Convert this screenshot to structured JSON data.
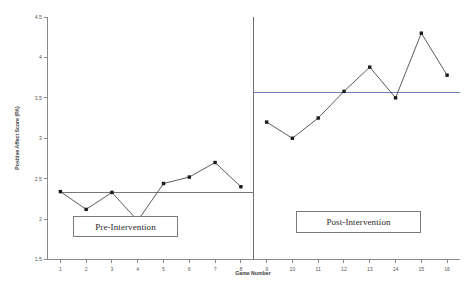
{
  "chart_data": {
    "type": "line",
    "title": "",
    "xlabel": "Game Number",
    "ylabel": "Positive Affect Score (PA)",
    "xlim": [
      0.5,
      16.5
    ],
    "ylim": [
      1.5,
      4.5
    ],
    "grid": false,
    "legend": null,
    "x": [
      1,
      2,
      3,
      4,
      5,
      6,
      7,
      8,
      9,
      10,
      11,
      12,
      13,
      14,
      15,
      16
    ],
    "xticklabels": [
      "1",
      "2",
      "3",
      "4",
      "5",
      "6",
      "7",
      "8",
      "9",
      "10",
      "11",
      "12",
      "13",
      "14",
      "15",
      "16"
    ],
    "yticks": [
      1.5,
      2,
      2.5,
      3,
      3.5,
      4,
      4.5
    ],
    "yticklabels": [
      "1.5",
      "2",
      "2.5",
      "3",
      "3.5",
      "4",
      "4.5"
    ],
    "series": [
      {
        "name": "Pre-Intervention",
        "x": [
          1,
          2,
          3,
          4,
          5,
          6,
          7,
          8
        ],
        "values": [
          2.34,
          2.12,
          2.33,
          1.98,
          2.44,
          2.52,
          2.7,
          2.4
        ]
      },
      {
        "name": "Post-Intervention",
        "x": [
          9,
          10,
          11,
          12,
          13,
          14,
          15,
          16
        ],
        "values": [
          3.2,
          3.0,
          3.25,
          3.58,
          3.88,
          3.5,
          4.3,
          3.78
        ]
      }
    ],
    "mean_lines": [
      {
        "name": "pre-intervention-mean",
        "value": 2.33,
        "x_start": 1,
        "x_end": 8.5,
        "color": "#777777"
      },
      {
        "name": "post-intervention-mean",
        "value": 3.56,
        "x_start": 8.5,
        "x_end": 16.5,
        "color": "#6a7fbf"
      }
    ],
    "phase_divider_x": 8.5,
    "annotations": [
      {
        "name": "pre-intervention-label",
        "text": "Pre-Intervention"
      },
      {
        "name": "post-intervention-label",
        "text": "Post-Intervention"
      }
    ]
  },
  "labels": {
    "y_axis_title": "Positive Affect Score (PA)",
    "x_axis_title": "Game Number",
    "phase_pre": "Pre-Intervention",
    "phase_post": "Post-Intervention"
  },
  "colors": {
    "series": "#4a4a4a",
    "marker": "#1a1a1a",
    "axis": "#8a8a8a",
    "mean_pre": "#777777",
    "mean_post": "#6a7fbf",
    "background": "#ffffff"
  }
}
